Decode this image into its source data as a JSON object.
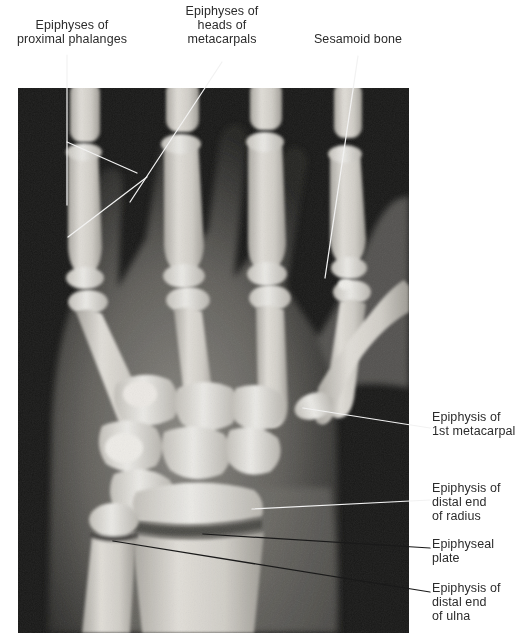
{
  "figure": {
    "kind": "radiograph",
    "view": "anteroposterior hand and wrist",
    "plate": {
      "x": 18,
      "y": 88,
      "width": 391,
      "height": 545,
      "background_color": "#121212",
      "bone_color": "#e8e6e0",
      "soft_tissue_color": "#6e6c68"
    },
    "page_background": "#ffffff",
    "text_color": "#2b2b2b",
    "leader_color_light": "#f2f2f2",
    "leader_color_dark": "#1a1a1a"
  },
  "labels": {
    "proximal_phalanges": "Epiphyses of\nproximal phalanges",
    "metacarpal_heads": "Epiphyses of\nheads of\nmetacarpals",
    "sesamoid": "Sesamoid bone",
    "first_metacarpal": "Epiphysis of\n1st metacarpal",
    "distal_radius": "Epiphysis of\ndistal end\nof radius",
    "epiphyseal_plate": "Epiphyseal\nplate",
    "distal_ulna": "Epiphysis of\ndistal end\nof ulna"
  },
  "leaders": [
    {
      "name": "proximal-phalanges-stem",
      "shade": "light",
      "points": [
        [
          67,
          55
        ],
        [
          67,
          205
        ]
      ]
    },
    {
      "name": "proximal-phalanges-branch",
      "shade": "light",
      "points": [
        [
          67,
          142
        ],
        [
          137,
          173
        ]
      ]
    },
    {
      "name": "proximal-phalanges-long",
      "shade": "light",
      "points": [
        [
          147,
          177
        ],
        [
          68,
          237
        ]
      ]
    },
    {
      "name": "metacarpal-heads-leader",
      "shade": "light",
      "points": [
        [
          222,
          62
        ],
        [
          130,
          202
        ]
      ]
    },
    {
      "name": "sesamoid-leader",
      "shade": "light",
      "points": [
        [
          358,
          56
        ],
        [
          325,
          278
        ]
      ]
    },
    {
      "name": "first-metacarpal-leader",
      "shade": "light",
      "points": [
        [
          430,
          428
        ],
        [
          303,
          408
        ]
      ]
    },
    {
      "name": "distal-radius-leader",
      "shade": "light",
      "points": [
        [
          430,
          500
        ],
        [
          252,
          509
        ]
      ]
    },
    {
      "name": "epiphyseal-plate-leader",
      "shade": "dark",
      "points": [
        [
          430,
          548
        ],
        [
          203,
          534
        ]
      ]
    },
    {
      "name": "distal-ulna-leader",
      "shade": "dark",
      "points": [
        [
          430,
          592
        ],
        [
          113,
          541
        ]
      ]
    }
  ]
}
